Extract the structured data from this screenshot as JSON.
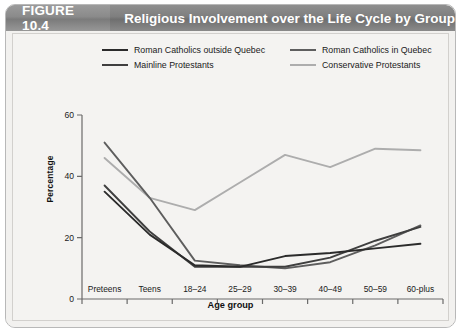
{
  "figure": {
    "number_label": "FIGURE 10.4",
    "title": "Religious Involvement over the Life Cycle by Group"
  },
  "chart_data": {
    "type": "line",
    "title": "Religious Involvement over the Life Cycle by Group",
    "xlabel": "Age group",
    "ylabel": "Percentage",
    "ylim": [
      0,
      60
    ],
    "yticks": [
      0,
      20,
      40,
      60
    ],
    "grid": false,
    "legend_position": "top",
    "categories": [
      "Preteens",
      "Teens",
      "18–24",
      "25–29",
      "30–39",
      "40–49",
      "50–59",
      "60-plus"
    ],
    "series": [
      {
        "name": "Roman Catholics outside Quebec",
        "color": "#2b2b2b",
        "values": [
          35,
          21,
          11,
          10.5,
          14,
          15,
          16.5,
          18
        ]
      },
      {
        "name": "Roman Catholics in Quebec",
        "color": "#5e5e5e",
        "values": [
          51,
          33,
          12.5,
          11,
          10,
          12,
          17.5,
          24
        ]
      },
      {
        "name": "Mainline Protestants",
        "color": "#3f3f3f",
        "values": [
          37,
          22,
          10.5,
          10.5,
          10.5,
          13.5,
          19,
          23.5
        ]
      },
      {
        "name": "Conservative Protestants",
        "color": "#adadad",
        "values": [
          46,
          33,
          29,
          38,
          47,
          43,
          49,
          48.5
        ]
      }
    ]
  }
}
